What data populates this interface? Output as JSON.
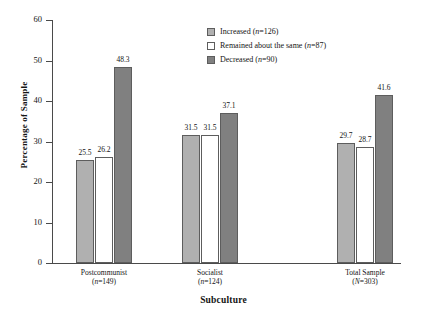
{
  "chart_data": {
    "type": "bar",
    "title": "",
    "xlabel": "Subculture",
    "ylabel": "Percentage of Sample",
    "ylim": [
      0,
      60
    ],
    "yticks": [
      0,
      10,
      20,
      30,
      40,
      50,
      60
    ],
    "grid": false,
    "legend_position": "top-right",
    "categories": [
      "Postcommunist (n=149)",
      "Socialist (n=124)",
      "Total Sample (N=303)"
    ],
    "category_labels": [
      {
        "name": "Postcommunist",
        "sub": "(n=149)"
      },
      {
        "name": "Socialist",
        "sub": "(n=124)"
      },
      {
        "name": "Total Sample",
        "sub": "(N=303)"
      }
    ],
    "series": [
      {
        "name": "Increased (n=126)",
        "color": "#b0b0b0",
        "values": [
          25.5,
          31.5,
          29.7
        ]
      },
      {
        "name": "Remained about the same (n=87)",
        "color": "#ffffff",
        "values": [
          26.2,
          31.5,
          28.7
        ]
      },
      {
        "name": "Decreased (n=90)",
        "color": "#808080",
        "values": [
          48.3,
          37.1,
          41.6
        ]
      }
    ],
    "legend": [
      "Increased (n=126)",
      "Remained about the same (n=87)",
      "Decreased (n=90)"
    ],
    "axis_color": "#4a4a4a",
    "bar_border_color": "#5d5d5d"
  }
}
